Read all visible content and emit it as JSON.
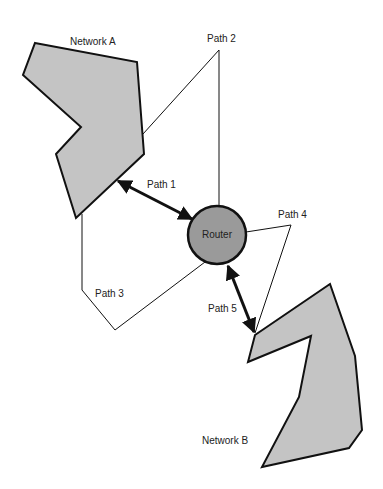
{
  "diagram": {
    "nodes": {
      "network_a": {
        "label": "Network A",
        "fill": "#c4c4c4"
      },
      "network_b": {
        "label": "Network B",
        "fill": "#c4c4c4"
      },
      "router": {
        "label": "Router",
        "fill": "#9a9a9a"
      }
    },
    "paths": [
      {
        "id": "path1",
        "label": "Path 1",
        "style": "bold double arrow",
        "from": "Network A",
        "to": "Router"
      },
      {
        "id": "path2",
        "label": "Path 2",
        "style": "thin line",
        "from": "Network A",
        "to": "Router"
      },
      {
        "id": "path3",
        "label": "Path 3",
        "style": "thin line",
        "from": "Network A",
        "to": "Router"
      },
      {
        "id": "path4",
        "label": "Path 4",
        "style": "thin line",
        "from": "Router",
        "to": "Network B"
      },
      {
        "id": "path5",
        "label": "Path 5",
        "style": "bold double arrow",
        "from": "Router",
        "to": "Network B"
      }
    ]
  }
}
